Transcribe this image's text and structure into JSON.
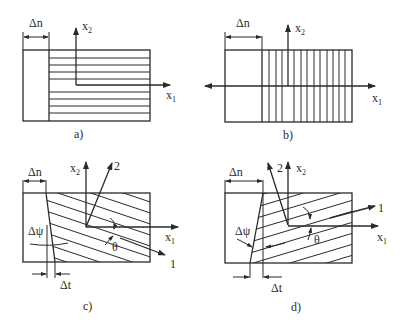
{
  "panels": {
    "a": {
      "caption": "a)",
      "dim_label": "Δn",
      "axis_x": "x",
      "axis_x_sub": "1",
      "axis_y": "x",
      "axis_y_sub": "2"
    },
    "b": {
      "caption": "b)",
      "dim_label": "Δn",
      "axis_x": "x",
      "axis_x_sub": "1",
      "axis_y": "x",
      "axis_y_sub": "2"
    },
    "c": {
      "caption": "c)",
      "dim_label": "Δn",
      "axis_x": "x",
      "axis_x_sub": "1",
      "axis_y": "x",
      "axis_y_sub": "2",
      "dir_1": "1",
      "dir_2": "2",
      "angle_label": "θ",
      "delta_psi": "Δψ",
      "delta_t": "Δt"
    },
    "d": {
      "caption": "d)",
      "dim_label": "Δn",
      "axis_x": "x",
      "axis_x_sub": "1",
      "axis_y": "x",
      "axis_y_sub": "2",
      "dir_1": "1",
      "dir_2": "2",
      "angle_label": "θ",
      "delta_psi": "Δψ",
      "delta_t": "Δt"
    }
  },
  "colors": {
    "ink": "#2a2a2a",
    "background": "#ffffff"
  }
}
